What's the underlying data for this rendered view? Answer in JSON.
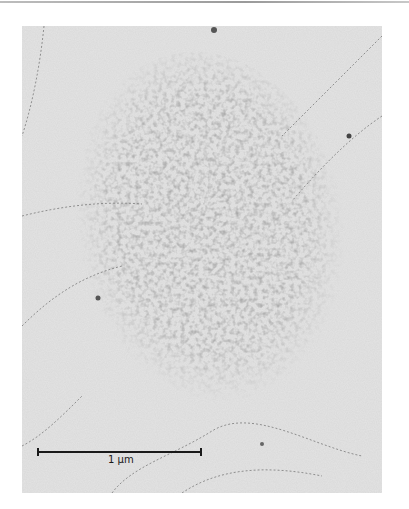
{
  "figure": {
    "type": "electron-micrograph",
    "scale_bar": {
      "label": "1 µm",
      "color": "#1a1a1a"
    },
    "colors": {
      "background": "#ffffff",
      "field": "#e6e6e6",
      "particles": "#8a8a8a",
      "fibers": "#7a7a7a"
    }
  }
}
